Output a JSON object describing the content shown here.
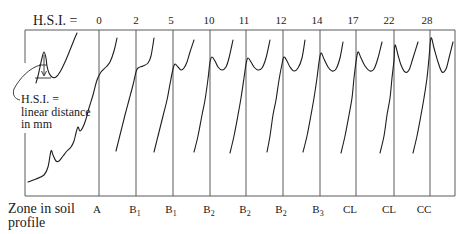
{
  "diagram": {
    "title_label": "H.S.I. =",
    "hsi_values": [
      {
        "label": "0",
        "x": 99
      },
      {
        "label": "2",
        "x": 136
      },
      {
        "label": "5",
        "x": 171
      },
      {
        "label": "10",
        "x": 209
      },
      {
        "label": "11",
        "x": 244
      },
      {
        "label": "12",
        "x": 281
      },
      {
        "label": "14",
        "x": 317
      },
      {
        "label": "17",
        "x": 353
      },
      {
        "label": "22",
        "x": 389
      },
      {
        "label": "28",
        "x": 427
      }
    ],
    "column_lines_x": [
      99,
      136,
      173,
      210,
      246,
      283,
      320,
      356,
      394,
      430
    ],
    "frame": {
      "left": 25,
      "top": 30,
      "right": 455,
      "bottom": 196
    },
    "zone_axis_label": {
      "line1": "Zone in soil",
      "line2": "profile"
    },
    "zones": [
      {
        "main": "A",
        "sub": "",
        "x": 97
      },
      {
        "main": "B",
        "sub": "1",
        "x": 135
      },
      {
        "main": "B",
        "sub": "1",
        "x": 171
      },
      {
        "main": "B",
        "sub": "2",
        "x": 209
      },
      {
        "main": "B",
        "sub": "2",
        "x": 245
      },
      {
        "main": "B",
        "sub": "2",
        "x": 281
      },
      {
        "main": "B",
        "sub": "3",
        "x": 318
      },
      {
        "main": "CL",
        "sub": "",
        "x": 350
      },
      {
        "main": "CL",
        "sub": "",
        "x": 389
      },
      {
        "main": "CC",
        "sub": "",
        "x": 424
      }
    ],
    "inset_annotation": {
      "line1": "H.S.I. =",
      "line2": "linear distance",
      "line3": "in mm"
    },
    "inset_curve": [
      [
        36,
        83
      ],
      [
        38,
        76
      ],
      [
        40,
        67
      ],
      [
        42,
        58
      ],
      [
        44,
        52
      ],
      [
        46,
        58
      ],
      [
        47,
        66
      ],
      [
        49,
        73
      ],
      [
        52,
        77
      ],
      [
        56,
        77
      ],
      [
        60,
        72
      ],
      [
        65,
        62
      ],
      [
        70,
        50
      ],
      [
        74,
        40
      ],
      [
        77,
        33
      ]
    ],
    "curves": [
      {
        "hsi": "0",
        "zone": "A",
        "points": [
          [
            28,
            182
          ],
          [
            36,
            179
          ],
          [
            44,
            175
          ],
          [
            48,
            167
          ],
          [
            51,
            151
          ],
          [
            53,
            155
          ],
          [
            56,
            161
          ],
          [
            59,
            161
          ],
          [
            63,
            156
          ],
          [
            67,
            151
          ],
          [
            71,
            147
          ],
          [
            74,
            141
          ],
          [
            76,
            133
          ],
          [
            78,
            127
          ],
          [
            80,
            131
          ],
          [
            83,
            127
          ],
          [
            86,
            119
          ],
          [
            89,
            108
          ],
          [
            93,
            95
          ],
          [
            97,
            80
          ],
          [
            101,
            72
          ],
          [
            106,
            67
          ],
          [
            110,
            62
          ],
          [
            114,
            51
          ],
          [
            117,
            38
          ]
        ]
      },
      {
        "hsi": "2",
        "zone": "B1",
        "points": [
          [
            116,
            151
          ],
          [
            120,
            135
          ],
          [
            125,
            115
          ],
          [
            129,
            100
          ],
          [
            133,
            85
          ],
          [
            136,
            72
          ],
          [
            138,
            68
          ],
          [
            143,
            66
          ],
          [
            148,
            63
          ],
          [
            151,
            56
          ],
          [
            154,
            38
          ]
        ]
      },
      {
        "hsi": "5",
        "zone": "B1",
        "points": [
          [
            154,
            152
          ],
          [
            158,
            136
          ],
          [
            163,
            116
          ],
          [
            167,
            100
          ],
          [
            170,
            84
          ],
          [
            173,
            69
          ],
          [
            175,
            64
          ],
          [
            178,
            67
          ],
          [
            181,
            70
          ],
          [
            184,
            68
          ],
          [
            187,
            62
          ],
          [
            190,
            52
          ],
          [
            194,
            40
          ]
        ]
      },
      {
        "hsi": "10",
        "zone": "B2",
        "points": [
          [
            194,
            152
          ],
          [
            198,
            136
          ],
          [
            202,
            115
          ],
          [
            205,
            100
          ],
          [
            208,
            79
          ],
          [
            210,
            62
          ],
          [
            212,
            57
          ],
          [
            215,
            61
          ],
          [
            218,
            67
          ],
          [
            222,
            70
          ],
          [
            226,
            67
          ],
          [
            229,
            58
          ],
          [
            233,
            40
          ]
        ]
      },
      {
        "hsi": "11",
        "zone": "B2",
        "points": [
          [
            230,
            153
          ],
          [
            234,
            136
          ],
          [
            238,
            115
          ],
          [
            241,
            98
          ],
          [
            244,
            78
          ],
          [
            246,
            64
          ],
          [
            248,
            58
          ],
          [
            251,
            62
          ],
          [
            254,
            67
          ],
          [
            258,
            70
          ],
          [
            262,
            68
          ],
          [
            266,
            58
          ],
          [
            270,
            40
          ]
        ]
      },
      {
        "hsi": "12",
        "zone": "B2",
        "points": [
          [
            267,
            152
          ],
          [
            270,
            136
          ],
          [
            273,
            115
          ],
          [
            276,
            100
          ],
          [
            279,
            80
          ],
          [
            282,
            64
          ],
          [
            284,
            57
          ],
          [
            287,
            61
          ],
          [
            290,
            67
          ],
          [
            294,
            71
          ],
          [
            298,
            68
          ],
          [
            302,
            58
          ],
          [
            305,
            40
          ]
        ]
      },
      {
        "hsi": "14",
        "zone": "B3",
        "points": [
          [
            303,
            152
          ],
          [
            307,
            136
          ],
          [
            311,
            115
          ],
          [
            314,
            98
          ],
          [
            317,
            78
          ],
          [
            319,
            62
          ],
          [
            321,
            53
          ],
          [
            324,
            59
          ],
          [
            328,
            67
          ],
          [
            332,
            71
          ],
          [
            336,
            69
          ],
          [
            340,
            58
          ],
          [
            343,
            42
          ]
        ]
      },
      {
        "hsi": "17",
        "zone": "CL",
        "points": [
          [
            341,
            153
          ],
          [
            345,
            136
          ],
          [
            349,
            115
          ],
          [
            352,
            98
          ],
          [
            354,
            78
          ],
          [
            356,
            62
          ],
          [
            358,
            52
          ],
          [
            361,
            58
          ],
          [
            365,
            66
          ],
          [
            370,
            71
          ],
          [
            374,
            69
          ],
          [
            378,
            58
          ],
          [
            382,
            42
          ]
        ]
      },
      {
        "hsi": "22",
        "zone": "CL",
        "points": [
          [
            380,
            153
          ],
          [
            384,
            136
          ],
          [
            387,
            115
          ],
          [
            390,
            98
          ],
          [
            392,
            78
          ],
          [
            394,
            60
          ],
          [
            395,
            45
          ],
          [
            398,
            55
          ],
          [
            401,
            65
          ],
          [
            405,
            72
          ],
          [
            409,
            70
          ],
          [
            413,
            58
          ],
          [
            418,
            42
          ]
        ]
      },
      {
        "hsi": "28",
        "zone": "CC",
        "points": [
          [
            413,
            153
          ],
          [
            417,
            136
          ],
          [
            421,
            115
          ],
          [
            424,
            98
          ],
          [
            427,
            78
          ],
          [
            429,
            58
          ],
          [
            431,
            38
          ],
          [
            434,
            48
          ],
          [
            438,
            62
          ],
          [
            442,
            72
          ],
          [
            446,
            69
          ],
          [
            449,
            58
          ],
          [
            453,
            42
          ]
        ]
      }
    ]
  }
}
